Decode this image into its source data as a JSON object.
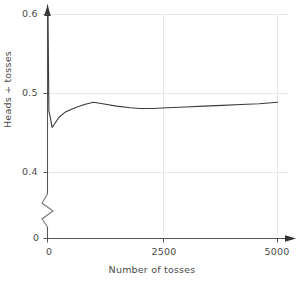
{
  "chart_data": {
    "type": "line",
    "title": "",
    "xlabel": "Number of tosses",
    "ylabel": "Heads ÷ tosses",
    "xlim": [
      0,
      5000
    ],
    "ylim": [
      0.4,
      0.6
    ],
    "y_axis_broken": true,
    "y_break_between": [
      0,
      0.4
    ],
    "grid": true,
    "grid_color": "#e8e8e8",
    "line_color": "#3c3c3c",
    "legend": null,
    "x_ticks": [
      {
        "value": 0,
        "label": "0"
      },
      {
        "value": 2500,
        "label": "2500"
      },
      {
        "value": 5000,
        "label": "5000"
      }
    ],
    "y_ticks": [
      {
        "value": 0.0,
        "label": "0"
      },
      {
        "value": 0.4,
        "label": "0.4"
      },
      {
        "value": 0.5,
        "label": "0.5"
      },
      {
        "value": 0.6,
        "label": "0.6"
      }
    ],
    "series": [
      {
        "name": "running proportion of heads",
        "x": [
          10,
          30,
          60,
          100,
          160,
          250,
          400,
          600,
          800,
          1000,
          1200,
          1500,
          1800,
          2000,
          2300,
          2600,
          3000,
          3400,
          3800,
          4200,
          4600,
          5000
        ],
        "values": [
          0.605,
          0.478,
          0.47,
          0.457,
          0.462,
          0.47,
          0.477,
          0.482,
          0.486,
          0.489,
          0.487,
          0.484,
          0.482,
          0.481,
          0.481,
          0.482,
          0.483,
          0.484,
          0.485,
          0.486,
          0.487,
          0.489
        ]
      }
    ]
  },
  "axes": {
    "x_arrow": true,
    "y_arrow": true,
    "y_break_symbol": "zigzag"
  },
  "labels": {
    "y_06": "0.6",
    "y_05": "0.5",
    "y_04": "0.4",
    "y_0": "0",
    "x_0": "0",
    "x_2500": "2500",
    "x_5000": "5000",
    "x_title": "Number of tosses",
    "y_title": "Heads ÷ tosses"
  }
}
